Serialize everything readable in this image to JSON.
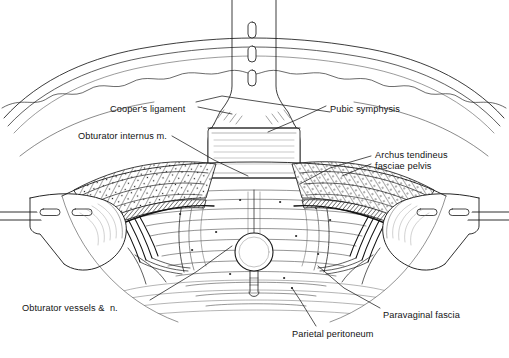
{
  "figure": {
    "background_color": "#ffffff",
    "ink_color": "#1a1a1a",
    "width": 509,
    "height": 358
  },
  "labels": [
    {
      "id": "coopers-ligament",
      "text": "Cooper's ligament",
      "x": 110,
      "y": 104,
      "align": "left"
    },
    {
      "id": "obturator-internus-muscle",
      "text": "Obturator internus m.",
      "x": 78,
      "y": 131,
      "align": "left"
    },
    {
      "id": "pubic-symphysis",
      "text": "Pubic symphysis",
      "x": 330,
      "y": 104,
      "align": "left"
    },
    {
      "id": "archus-tendineus-fasciae-pelvis",
      "text": "Archus tendineus\nfasciae pelvis",
      "x": 375,
      "y": 150,
      "align": "left"
    },
    {
      "id": "obturator-vessels-and-nerve",
      "text": "Obturator vessels &  n.",
      "x": 22,
      "y": 303,
      "align": "left"
    },
    {
      "id": "parietal-peritoneum",
      "text": "Parietal peritoneum",
      "x": 292,
      "y": 329,
      "align": "left"
    },
    {
      "id": "paravaginal-fascia",
      "text": "Paravaginal fascia",
      "x": 383,
      "y": 310,
      "align": "left"
    }
  ],
  "structures": [
    {
      "id": "central-retractor-blade",
      "name": "central retractor blade",
      "slots": 3
    },
    {
      "id": "left-retractor-blade",
      "name": "left lateral retractor blade",
      "slots": 2
    },
    {
      "id": "right-retractor-blade",
      "name": "right lateral retractor blade",
      "slots": 2
    },
    {
      "id": "abdominal-wall-drape",
      "name": "abdominal wall skin edge"
    },
    {
      "id": "urethral-catheter-ring",
      "name": "urethral catheter with balloon ring"
    },
    {
      "id": "fatty-tissue-band-left",
      "name": "retropubic fat pad, left"
    },
    {
      "id": "fatty-tissue-band-right",
      "name": "retropubic fat pad, right"
    },
    {
      "id": "bladder-surface",
      "name": "bladder anterior surface"
    }
  ]
}
